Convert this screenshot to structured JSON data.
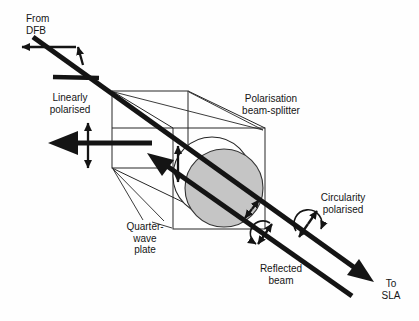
{
  "figure": {
    "labels": {
      "from_dfb": "From\nDFB",
      "linearly_polarised": "Linearly\npolarised",
      "beam_splitter": "Polarisation\nbeam-splitter",
      "circularity_polarised": "Circularity\npolarised",
      "quarter_wave_plate": "Quarter-\nwave\nplate",
      "reflected_beam": "Reflected\nbeam",
      "to_sla": "To\nSLA"
    },
    "colors": {
      "background": "#fefefe",
      "ink": "#141414",
      "disk_fill": "#c5c5c5",
      "wireframe": "#262626"
    },
    "elements": [
      "beam-splitter-cube-wireframe",
      "quarter-wave-plate-disk",
      "input-beam-from-dfb",
      "output-beam-to-sla",
      "reflected-return-beam",
      "rejected-beam-left",
      "linear-polarisation-double-arrows",
      "circular-polarisation-arc-arrows"
    ]
  }
}
